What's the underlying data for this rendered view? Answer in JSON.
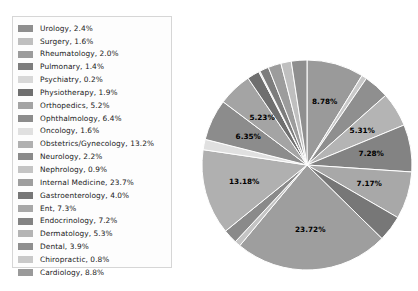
{
  "chart_data": {
    "type": "pie",
    "title": "",
    "subtitle": "",
    "xlabel": "",
    "ylabel": "",
    "grid": false,
    "legend_position": "left",
    "label_format": "percent_2dp",
    "label_threshold_percent": 5,
    "start_angle_oclock": 12,
    "direction": "clockwise",
    "categories": [
      "Cardiology",
      "Chiropractic",
      "Dental",
      "Dermatology",
      "Endocrinology",
      "Ent",
      "Gastroenterology",
      "Internal Medicine",
      "Nephrology",
      "Neurology",
      "Obstetrics/Gynecology",
      "Oncology",
      "Ophthalmology",
      "Orthopedics",
      "Physiotherapy",
      "Psychiatry",
      "Pulmonary",
      "Rheumatology",
      "Surgery",
      "Urology"
    ],
    "values": [
      8.78,
      0.8,
      3.9,
      5.31,
      7.28,
      7.3,
      4.0,
      23.72,
      0.9,
      2.2,
      13.18,
      1.6,
      6.35,
      5.23,
      1.9,
      0.2,
      1.4,
      2.0,
      1.6,
      2.4
    ],
    "slice_labels": [
      "8.78%",
      "",
      "",
      "5.31%",
      "7.28%",
      "7.17%",
      "",
      "23.72%",
      "",
      "",
      "13.18%",
      "",
      "6.35%",
      "5.23%",
      "",
      "",
      "",
      "",
      "",
      ""
    ],
    "slice_colors": [
      "#9a9a9a",
      "#c9c9c9",
      "#8f8f8f",
      "#b4b4b4",
      "#838383",
      "#a8a8a8",
      "#777777",
      "#9e9e9e",
      "#c4c4c4",
      "#8a8a8a",
      "#b0b0b0",
      "#e0e0e0",
      "#8c8c8c",
      "#a4a4a4",
      "#6f6f6f",
      "#d8d8d8",
      "#7d7d7d",
      "#9c9c9c",
      "#bfbfbf",
      "#8f8f8f"
    ]
  },
  "legend": {
    "items": [
      {
        "label": "Urology, 2.4%",
        "color": "#8f8f8f"
      },
      {
        "label": "Surgery, 1.6%",
        "color": "#bfbfbf"
      },
      {
        "label": "Rheumatology, 2.0%",
        "color": "#9c9c9c"
      },
      {
        "label": "Pulmonary, 1.4%",
        "color": "#7d7d7d"
      },
      {
        "label": "Psychiatry, 0.2%",
        "color": "#d8d8d8"
      },
      {
        "label": "Physiotherapy, 1.9%",
        "color": "#6f6f6f"
      },
      {
        "label": "Orthopedics, 5.2%",
        "color": "#a4a4a4"
      },
      {
        "label": "Ophthalmology, 6.4%",
        "color": "#8c8c8c"
      },
      {
        "label": "Oncology, 1.6%",
        "color": "#e0e0e0"
      },
      {
        "label": "Obstetrics/Gynecology, 13.2%",
        "color": "#b0b0b0"
      },
      {
        "label": "Neurology, 2.2%",
        "color": "#8a8a8a"
      },
      {
        "label": "Nephrology, 0.9%",
        "color": "#c4c4c4"
      },
      {
        "label": "Internal Medicine, 23.7%",
        "color": "#9e9e9e"
      },
      {
        "label": "Gastroenterology, 4.0%",
        "color": "#777777"
      },
      {
        "label": "Ent, 7.3%",
        "color": "#a8a8a8"
      },
      {
        "label": "Endocrinology, 7.2%",
        "color": "#838383"
      },
      {
        "label": "Dermatology, 5.3%",
        "color": "#b4b4b4"
      },
      {
        "label": "Dental, 3.9%",
        "color": "#8f8f8f"
      },
      {
        "label": "Chiropractic, 0.8%",
        "color": "#c9c9c9"
      },
      {
        "label": "Cardiology, 8.8%",
        "color": "#9a9a9a"
      }
    ]
  }
}
